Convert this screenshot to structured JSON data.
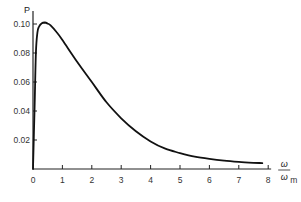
{
  "chart_data": {
    "type": "line",
    "title": "",
    "xlabel": "ω/ω_m",
    "xlabel_num": "ω",
    "xlabel_den": "ω",
    "xlabel_sub": "m",
    "ylabel": "P",
    "xlim": [
      0,
      8
    ],
    "ylim": [
      0,
      0.1
    ],
    "grid": false,
    "legend": null,
    "x_ticks": [
      "0",
      "1",
      "2",
      "3",
      "4",
      "5",
      "6",
      "7",
      "8"
    ],
    "y_ticks": [
      "0.02",
      "0.04",
      "0.06",
      "0.08",
      "0.10"
    ],
    "series": [
      {
        "name": "P",
        "x": [
          0.0,
          0.05,
          0.1,
          0.15,
          0.2,
          0.3,
          0.4,
          0.5,
          0.6,
          0.8,
          1.0,
          1.5,
          2.0,
          2.5,
          3.0,
          3.5,
          4.0,
          4.5,
          5.0,
          5.5,
          6.0,
          6.5,
          7.0,
          7.5,
          7.8
        ],
        "y": [
          0.0,
          0.04,
          0.08,
          0.094,
          0.098,
          0.1005,
          0.101,
          0.1003,
          0.099,
          0.0945,
          0.089,
          0.074,
          0.06,
          0.046,
          0.035,
          0.026,
          0.019,
          0.014,
          0.011,
          0.0085,
          0.007,
          0.0058,
          0.0049,
          0.0043,
          0.0041
        ]
      }
    ]
  }
}
